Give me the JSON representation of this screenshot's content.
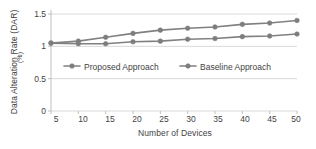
{
  "chart_data": {
    "type": "line",
    "title": "",
    "subtitle": "",
    "xlabel": "Number of Devices",
    "ylabel": "Data Alteration Rate (DAR)",
    "yunit": "(%)",
    "x": [
      5,
      10,
      15,
      20,
      25,
      30,
      35,
      40,
      45,
      50
    ],
    "xtick_labels": [
      "5",
      "10",
      "15",
      "20",
      "25",
      "30",
      "35",
      "40",
      "45",
      "50"
    ],
    "ytick_labels": [
      "0",
      "0.5",
      "1",
      "1.5"
    ],
    "ytick_values": [
      0,
      0.5,
      1,
      1.5
    ],
    "xlim": [
      5,
      50
    ],
    "ylim": [
      0,
      1.5
    ],
    "grid": true,
    "grid_axis": "y",
    "legend_position": "inside-center",
    "series": [
      {
        "name": "Proposed Approach",
        "color": "#808080",
        "marker": "circle",
        "values": [
          1.05,
          1.04,
          1.04,
          1.07,
          1.08,
          1.11,
          1.12,
          1.15,
          1.16,
          1.19
        ]
      },
      {
        "name": "Baseline Approach",
        "color": "#808080",
        "marker": "circle",
        "values": [
          1.05,
          1.08,
          1.14,
          1.2,
          1.25,
          1.28,
          1.3,
          1.34,
          1.36,
          1.4
        ]
      }
    ]
  },
  "axes": {
    "y_title": "Data Alteration Rate (DAR)",
    "y_unit": "(%)",
    "x_title": "Number of Devices",
    "y_ticks": [
      "1.5",
      "1",
      "0.5",
      "0"
    ],
    "x_ticks": [
      "5",
      "10",
      "15",
      "20",
      "25",
      "30",
      "35",
      "40",
      "45",
      "50"
    ]
  },
  "legend": {
    "items": [
      {
        "label": "Proposed Approach"
      },
      {
        "label": "Baseline Approach"
      }
    ]
  },
  "colors": {
    "line": "#808080",
    "marker": "#7d7d7d",
    "grid": "#d9d9d9",
    "axis": "#bfbfbf",
    "text": "#3f3f3f"
  }
}
